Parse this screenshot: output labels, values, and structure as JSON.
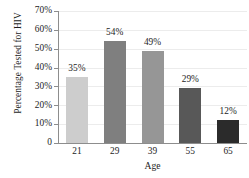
{
  "chart_data": {
    "type": "bar",
    "title": "",
    "categories": [
      "21",
      "29",
      "39",
      "55",
      "65"
    ],
    "values": [
      35,
      54,
      49,
      29,
      12
    ],
    "value_labels": [
      "35%",
      "54%",
      "49%",
      "29%",
      "12%"
    ],
    "bar_colors": [
      "#cdcdcd",
      "#7f7f7f",
      "#969696",
      "#585858",
      "#2b2b2b"
    ],
    "xlabel": "Age",
    "ylabel": "Percentage Tested for HIV",
    "ylim": [
      0,
      70
    ],
    "ytick_values": [
      70,
      60,
      50,
      40,
      30,
      20,
      10,
      0
    ],
    "ytick_labels": [
      "70%",
      "60%",
      "50%",
      "40%",
      "30%",
      "20%",
      "10%",
      "0"
    ],
    "grid": true,
    "grid_axis": "y",
    "grid_color": "#ececec",
    "axis_color": "#8d8d8d",
    "legend": null,
    "legend_position": "none",
    "background_color": "#ffffff",
    "text_color": "#1d1d1d"
  }
}
